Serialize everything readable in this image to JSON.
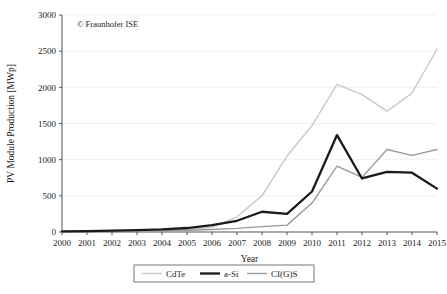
{
  "chart_data": {
    "type": "line",
    "title": "",
    "xlabel": "Year",
    "ylabel": "PV Module Production [MWp]",
    "xlim": [
      2000,
      2015
    ],
    "ylim": [
      0,
      3000
    ],
    "grid": "horizontal",
    "legend_position": "bottom-outside",
    "x": [
      2000,
      2001,
      2002,
      2003,
      2004,
      2005,
      2006,
      2007,
      2008,
      2009,
      2010,
      2011,
      2012,
      2013,
      2014,
      2015
    ],
    "xtick_labels": [
      "2000",
      "2001",
      "2002",
      "2003",
      "2004",
      "2005",
      "2006",
      "2007",
      "2008",
      "2009",
      "2010",
      "2011",
      "2012",
      "2013",
      "2014",
      "2015"
    ],
    "ytick_labels": [
      "0",
      "500",
      "1000",
      "1500",
      "2000",
      "2500",
      "3000"
    ],
    "yticks": [
      0,
      500,
      1000,
      1500,
      2000,
      2500,
      3000
    ],
    "series": [
      {
        "name": "CdTe",
        "color": "#c8c8c8",
        "width": 1.4,
        "values": [
          5,
          8,
          12,
          18,
          25,
          35,
          65,
          210,
          500,
          1050,
          1470,
          2040,
          1900,
          1670,
          1920,
          2530
        ]
      },
      {
        "name": "a-Si",
        "color": "#1a1a1a",
        "width": 2.3,
        "values": [
          10,
          13,
          18,
          25,
          35,
          55,
          95,
          155,
          280,
          250,
          560,
          1340,
          740,
          830,
          820,
          600
        ]
      },
      {
        "name": "CI(G)S",
        "color": "#9a9a9a",
        "width": 1.4,
        "values": [
          4,
          6,
          9,
          13,
          18,
          25,
          35,
          50,
          75,
          95,
          400,
          910,
          755,
          1140,
          1060,
          1140
        ]
      }
    ],
    "annotations": [
      {
        "text": "© Fraunhofer ISE",
        "x": 2000.6,
        "y": 2830
      }
    ]
  },
  "legend": {
    "items": [
      {
        "label": "CdTe"
      },
      {
        "label": "a-Si"
      },
      {
        "label": "CI(G)S"
      }
    ]
  },
  "colors": {
    "cdte": "#c8c8c8",
    "asi": "#1a1a1a",
    "cigs": "#9a9a9a",
    "axis": "#555555",
    "grid": "#f0f0f0",
    "text": "#1a1a1a"
  }
}
